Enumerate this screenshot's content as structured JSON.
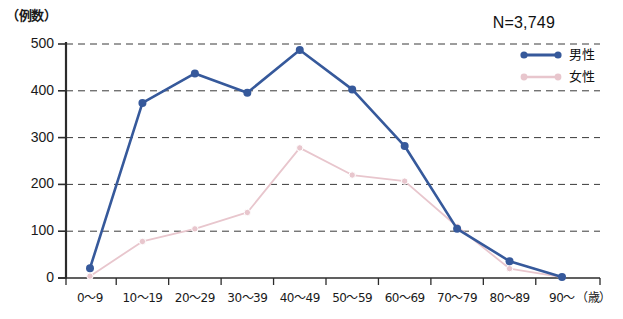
{
  "chart_data": {
    "type": "line",
    "title": "",
    "subtitle": "",
    "unit_label": "（例数）",
    "annotation": "N=3,749",
    "xlabel": "（歳）",
    "ylabel": "例数",
    "categories": [
      "0〜9",
      "10〜19",
      "20〜29",
      "30〜39",
      "40〜49",
      "50〜59",
      "60〜69",
      "70〜79",
      "80〜89",
      "90〜"
    ],
    "x_tick_labels": [
      "0〜9",
      "10〜19",
      "20〜29",
      "30〜39",
      "40〜49",
      "50〜59",
      "60〜69",
      "70〜79",
      "80〜89",
      "90〜"
    ],
    "y_tick_labels": [
      "500",
      "400",
      "300",
      "200",
      "100",
      "0"
    ],
    "y_ticks": [
      500,
      400,
      300,
      200,
      100,
      0
    ],
    "ylim": [
      0,
      500
    ],
    "grid": true,
    "grid_style": "dashed-horizontal",
    "legend_position": "top-right",
    "series": [
      {
        "name": "男性",
        "color": "#36599b",
        "marker": "circle",
        "values": [
          21,
          374,
          437,
          396,
          487,
          403,
          282,
          105,
          36,
          2
        ]
      },
      {
        "name": "女性",
        "color": "#e8c6cd",
        "marker": "circle",
        "values": [
          4,
          78,
          105,
          140,
          278,
          220,
          207,
          110,
          20,
          2
        ]
      }
    ]
  },
  "legend": {
    "items": [
      {
        "label": "男性",
        "color": "#36599b"
      },
      {
        "label": "女性",
        "color": "#e8c6cd"
      }
    ]
  },
  "caption": ""
}
